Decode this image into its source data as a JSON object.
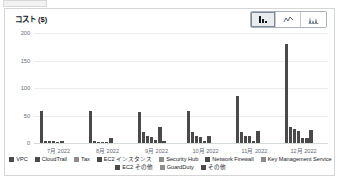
{
  "widget": {
    "title": "コスト ($)"
  },
  "chart_type_buttons": [
    {
      "name": "bar-chart-button",
      "icon": "bar-chart-icon",
      "label": "棒グラフ",
      "selected": true
    },
    {
      "name": "line-chart-button",
      "icon": "line-chart-icon",
      "label": "折れ線グラフ",
      "selected": false
    },
    {
      "name": "area-chart-button",
      "icon": "area-chart-icon",
      "label": "面グラフ",
      "selected": false
    }
  ],
  "legend": {
    "rows": [
      [
        {
          "label": "VPC",
          "color": "#4a4a4a"
        },
        {
          "label": "CloudTrail",
          "color": "#4a4a4a"
        },
        {
          "label": "Tax",
          "color": "#8c8c8c"
        },
        {
          "label": "EC2 インスタンス",
          "color": "#4a4a4a"
        },
        {
          "label": "Security Hub",
          "color": "#8c8c8c"
        },
        {
          "label": "Network Firewall",
          "color": "#4a4a4a"
        },
        {
          "label": "Key Management Service",
          "color": "#8c8c8c"
        }
      ],
      [
        {
          "label": "EC2 その他",
          "color": "#4a4a4a"
        },
        {
          "label": "GuardDuty",
          "color": "#8c8c8c"
        },
        {
          "label": "その他",
          "color": "#4a4a4a"
        }
      ]
    ]
  },
  "chart_data": {
    "type": "bar",
    "title": "コスト ($)",
    "xlabel": "",
    "ylabel": "コスト ($)",
    "ylim": [
      0,
      200
    ],
    "yticks": [
      0,
      50,
      100,
      150,
      200
    ],
    "ytick_labels": [
      "0",
      "50",
      "100",
      "150",
      "200"
    ],
    "grid": true,
    "legend_position": "bottom",
    "categories": [
      "7月 2022",
      "8月 2022",
      "9月 2022",
      "10月 2022",
      "11月 2022",
      "12月 2022"
    ],
    "series": [
      {
        "name": "VPC",
        "values": [
          58,
          59,
          56,
          58,
          85,
          180
        ]
      },
      {
        "name": "CloudTrail",
        "values": [
          4,
          3,
          20,
          20,
          20,
          29
        ]
      },
      {
        "name": "Tax",
        "values": [
          3,
          2,
          13,
          12,
          13,
          26
        ]
      },
      {
        "name": "EC2 インスタンス",
        "values": [
          3,
          2,
          11,
          11,
          12,
          22
        ]
      },
      {
        "name": "Security Hub",
        "values": [
          1,
          1,
          5,
          3,
          3,
          10
        ]
      },
      {
        "name": "Network Firewall",
        "values": [
          1,
          1,
          2,
          2,
          2,
          9
        ]
      },
      {
        "name": "Key Management Service",
        "values": [
          4,
          1,
          2,
          2,
          2,
          2
        ]
      },
      {
        "name": "EC2 その他",
        "values": [
          1,
          2,
          5,
          4,
          2,
          2
        ]
      },
      {
        "name": "GuardDuty",
        "values": [
          1,
          10,
          30,
          12,
          21,
          24
        ]
      },
      {
        "name": "その他",
        "values": [
          1,
          1,
          3,
          2,
          1,
          1
        ]
      }
    ],
    "bars": [
      {
        "group": 0,
        "series": "VPC",
        "value": 58
      },
      {
        "group": 0,
        "series": "CloudTrail",
        "value": 4
      },
      {
        "group": 0,
        "series": "Tax",
        "value": 3
      },
      {
        "group": 0,
        "series": "EC2 インスタンス",
        "value": 3
      },
      {
        "group": 0,
        "series": "Security Hub",
        "value": 1
      },
      {
        "group": 0,
        "series": "Network Firewall",
        "value": 4
      },
      {
        "group": 1,
        "series": "VPC",
        "value": 59
      },
      {
        "group": 1,
        "series": "CloudTrail",
        "value": 3
      },
      {
        "group": 1,
        "series": "Tax",
        "value": 2
      },
      {
        "group": 1,
        "series": "EC2 インスタンス",
        "value": 2
      },
      {
        "group": 1,
        "series": "Security Hub",
        "value": 1
      },
      {
        "group": 1,
        "series": "GuardDuty",
        "value": 10
      },
      {
        "group": 2,
        "series": "VPC",
        "value": 56
      },
      {
        "group": 2,
        "series": "CloudTrail",
        "value": 20
      },
      {
        "group": 2,
        "series": "Tax",
        "value": 13
      },
      {
        "group": 2,
        "series": "EC2 インスタンス",
        "value": 11
      },
      {
        "group": 2,
        "series": "Security Hub",
        "value": 5
      },
      {
        "group": 2,
        "series": "GuardDuty",
        "value": 30
      },
      {
        "group": 2,
        "series": "その他",
        "value": 3
      },
      {
        "group": 3,
        "series": "VPC",
        "value": 58
      },
      {
        "group": 3,
        "series": "CloudTrail",
        "value": 20
      },
      {
        "group": 3,
        "series": "Tax",
        "value": 12
      },
      {
        "group": 3,
        "series": "EC2 インスタンス",
        "value": 11
      },
      {
        "group": 3,
        "series": "Security Hub",
        "value": 3
      },
      {
        "group": 3,
        "series": "GuardDuty",
        "value": 12
      },
      {
        "group": 4,
        "series": "VPC",
        "value": 85
      },
      {
        "group": 4,
        "series": "CloudTrail",
        "value": 20
      },
      {
        "group": 4,
        "series": "Tax",
        "value": 13
      },
      {
        "group": 4,
        "series": "EC2 インスタンス",
        "value": 12
      },
      {
        "group": 4,
        "series": "Security Hub",
        "value": 3
      },
      {
        "group": 4,
        "series": "GuardDuty",
        "value": 21
      },
      {
        "group": 5,
        "series": "VPC",
        "value": 180
      },
      {
        "group": 5,
        "series": "CloudTrail",
        "value": 29
      },
      {
        "group": 5,
        "series": "Tax",
        "value": 26
      },
      {
        "group": 5,
        "series": "EC2 インスタンス",
        "value": 22
      },
      {
        "group": 5,
        "series": "Security Hub",
        "value": 10
      },
      {
        "group": 5,
        "series": "Network Firewall",
        "value": 9
      },
      {
        "group": 5,
        "series": "GuardDuty",
        "value": 24
      }
    ],
    "bar_color": "#4a4a4a"
  }
}
